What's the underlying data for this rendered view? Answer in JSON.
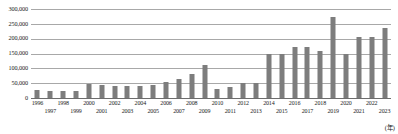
{
  "chart_data": {
    "type": "bar",
    "title": "",
    "subtitle": "",
    "xlabel": "(年)",
    "ylabel": "",
    "unit_note": "(年)",
    "grid": true,
    "legend": null,
    "legend_position": "none",
    "ylim": [
      0,
      300000
    ],
    "ytick_labels": [
      "300,000",
      "250,000",
      "200,000",
      "150,000",
      "100,000",
      "50,000",
      "0"
    ],
    "ytick_values": [
      300000,
      250000,
      200000,
      150000,
      100000,
      50000,
      0
    ],
    "categories": [
      "1996",
      "1997",
      "1998",
      "1999",
      "2000",
      "2001",
      "2002",
      "2003",
      "2004",
      "2005",
      "2006",
      "2007",
      "2008",
      "2009",
      "2010",
      "2011",
      "2012",
      "2013",
      "2014",
      "2015",
      "2016",
      "2017",
      "2018",
      "2019",
      "2020",
      "2021",
      "2022",
      "2023"
    ],
    "values": [
      26000,
      23000,
      25000,
      22000,
      47000,
      43000,
      41000,
      40000,
      41000,
      44000,
      54000,
      65000,
      80000,
      110000,
      31000,
      36000,
      51000,
      52000,
      147000,
      148000,
      171000,
      173000,
      157000,
      272000,
      150000,
      205000,
      205000,
      237000
    ],
    "bar_color": "#7d7d7d",
    "gridline_color": "#a8a8a8",
    "axis_color": "#6d6d6d",
    "background_color": "#ffffff"
  },
  "axes": {
    "y_label_format": "comma-separated thousands",
    "x_label_layout": "alternating two rows"
  }
}
